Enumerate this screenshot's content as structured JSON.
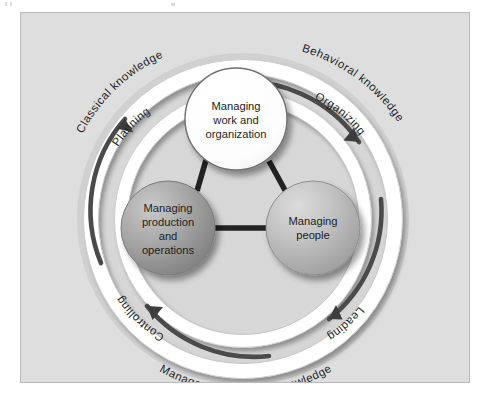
{
  "figure": {
    "panel_background": "#dedede",
    "panel_border": "#b9b9b9"
  },
  "nodes": [
    {
      "id": "managing-work-and-organization",
      "lines": [
        "Managing",
        "work and",
        "organization"
      ],
      "fill": "#ffffff",
      "cx": 215,
      "cy": 106,
      "r": 51
    },
    {
      "id": "managing-production-and-operations",
      "lines": [
        "Managing",
        "production",
        "and",
        "operations"
      ],
      "fill": "#9a9a9a",
      "cx": 147,
      "cy": 215,
      "r": 47
    },
    {
      "id": "managing-people",
      "lines": [
        "Managing",
        "people"
      ],
      "fill": "#b4b4b4",
      "cx": 292,
      "cy": 215,
      "r": 47
    }
  ],
  "phases": [
    {
      "id": "planning",
      "label": "Planning"
    },
    {
      "id": "organizing",
      "label": "Organizing"
    },
    {
      "id": "leading",
      "label": "Leading"
    },
    {
      "id": "controlling",
      "label": "Controlling"
    }
  ],
  "knowledge_bands": [
    {
      "id": "classical-knowledge",
      "label": "Classical knowledge"
    },
    {
      "id": "behavioral-knowledge",
      "label": "Behavioral knowledge"
    },
    {
      "id": "management-science-knowledge",
      "label": "Management science knowledge"
    }
  ],
  "colors": {
    "arc_dark": "#4a4a4a",
    "arc_band": "#ffffff",
    "arc_shadow": "#c2c2c2",
    "connector": "#222222",
    "text": "#1d1d1d"
  }
}
